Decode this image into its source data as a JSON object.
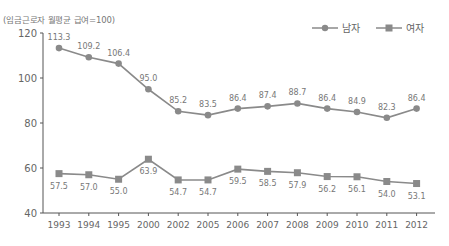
{
  "chart_data": {
    "type": "line",
    "title": "",
    "unit_label": "(임금근로자 월평균 급여=100)",
    "xlabel": "",
    "ylabel": "",
    "ylim": [
      40,
      120
    ],
    "yticks": [
      40,
      60,
      80,
      100,
      120
    ],
    "categories": [
      "1993",
      "1994",
      "1995",
      "2000",
      "2002",
      "2005",
      "2006",
      "2007",
      "2008",
      "2009",
      "2010",
      "2011",
      "2012"
    ],
    "series": [
      {
        "name": "남자",
        "marker": "circle",
        "color": "#8a8a8a",
        "values": [
          113.3,
          109.2,
          106.4,
          95.0,
          85.2,
          83.5,
          86.4,
          87.4,
          88.7,
          86.4,
          84.9,
          82.3,
          86.4
        ],
        "labels": [
          "113.3",
          "109.2",
          "106.4",
          "95.0",
          "85.2",
          "83.5",
          "86.4",
          "87.4",
          "88.7",
          "86.4",
          "84.9",
          "82.3",
          "86.4"
        ]
      },
      {
        "name": "여자",
        "marker": "square",
        "color": "#8a8a8a",
        "values": [
          57.5,
          57.0,
          55.0,
          63.9,
          54.7,
          54.7,
          59.5,
          58.5,
          57.9,
          56.2,
          56.1,
          54.0,
          53.1
        ],
        "labels": [
          "57.5",
          "57.0",
          "55.0",
          "63.9",
          "54.7",
          "54.7",
          "59.5",
          "58.5",
          "57.9",
          "56.2",
          "56.1",
          "54.0",
          "53.1"
        ]
      }
    ],
    "legend_position": "top-right",
    "grid": false
  },
  "legend": {
    "male": "남자",
    "female": "여자"
  },
  "colors": {
    "line": "#8a8a8a",
    "axis": "#555555",
    "text": "#777777"
  }
}
